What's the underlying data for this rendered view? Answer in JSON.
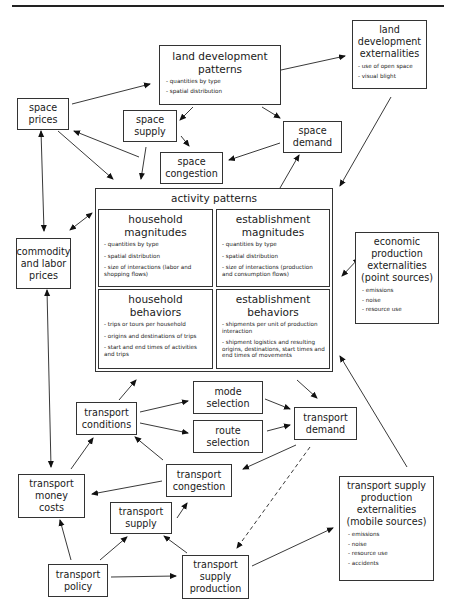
{
  "diagram": {
    "nodes": {
      "land_dev_patterns": {
        "title": "land development patterns",
        "title_l1": "land development",
        "title_l2": "patterns",
        "bullets": [
          "- quantities by type",
          "- spatial distribution"
        ]
      },
      "land_dev_externalities": {
        "title_l1": "land",
        "title_l2": "development",
        "title_l3": "externalities",
        "bullets": [
          "- use of open space",
          "- visual blight"
        ]
      },
      "space_prices": {
        "title_l1": "space",
        "title_l2": "prices"
      },
      "space_supply": {
        "title_l1": "space",
        "title_l2": "supply"
      },
      "space_demand": {
        "title_l1": "space",
        "title_l2": "demand"
      },
      "space_congestion": {
        "title_l1": "space",
        "title_l2": "congestion"
      },
      "activity_patterns": {
        "title": "activity patterns"
      },
      "household_magnitudes": {
        "title_l1": "household",
        "title_l2": "magnitudes",
        "bullets": [
          "- quantities by type",
          "- spatial distribution",
          "- size of interactions (labor and shopping flows)"
        ]
      },
      "establishment_magnitudes": {
        "title_l1": "establishment",
        "title_l2": "magnitudes",
        "bullets": [
          "- quantities by type",
          "- spatial distribution",
          "- size of interactions (production and consumption flows)"
        ]
      },
      "household_behaviors": {
        "title_l1": "household",
        "title_l2": "behaviors",
        "bullets": [
          "- trips or tours per household",
          "- origins and destinations of trips",
          "- start and end times of activities and trips"
        ]
      },
      "establishment_behaviors": {
        "title_l1": "establishment",
        "title_l2": "behaviors",
        "bullets": [
          "- shipments per unit of production interaction",
          "- shipment logistics and resulting origins, destinations, start times and end times of movements"
        ]
      },
      "commodity_labor_prices": {
        "title_l1": "commodity",
        "title_l2": "and labor",
        "title_l3": "prices"
      },
      "economic_externalities": {
        "title_l1": "economic",
        "title_l2": "production",
        "title_l3": "externalities",
        "title_l4": "(point sources)",
        "bullets": [
          "- emissions",
          "- noise",
          "- resource use"
        ]
      },
      "transport_conditions": {
        "title_l1": "transport",
        "title_l2": "conditions"
      },
      "mode_selection": {
        "title_l1": "mode",
        "title_l2": "selection"
      },
      "route_selection": {
        "title_l1": "route",
        "title_l2": "selection"
      },
      "transport_demand": {
        "title_l1": "transport",
        "title_l2": "demand"
      },
      "transport_congestion": {
        "title_l1": "transport",
        "title_l2": "congestion"
      },
      "transport_money_costs": {
        "title_l1": "transport",
        "title_l2": "money",
        "title_l3": "costs"
      },
      "transport_supply": {
        "title_l1": "transport",
        "title_l2": "supply"
      },
      "transport_policy": {
        "title_l1": "transport",
        "title_l2": "policy"
      },
      "transport_supply_production": {
        "title_l1": "transport",
        "title_l2": "supply",
        "title_l3": "production"
      },
      "transport_externalities": {
        "title_l1": "transport supply",
        "title_l2": "production",
        "title_l3": "externalities",
        "title_l4": "(mobile sources)",
        "bullets": [
          "- emissions",
          "- noise",
          "- resource use",
          "- accidents"
        ]
      }
    },
    "edges": [
      {
        "from": "space_prices",
        "to": "land_dev_patterns",
        "style": "solid"
      },
      {
        "from": "land_dev_patterns",
        "to": "land_dev_externalities",
        "style": "solid"
      },
      {
        "from": "land_dev_patterns",
        "to": "space_supply",
        "style": "solid"
      },
      {
        "from": "land_dev_patterns",
        "to": "space_demand",
        "style": "solid"
      },
      {
        "from": "space_supply",
        "to": "space_congestion",
        "style": "solid"
      },
      {
        "from": "space_demand",
        "to": "space_congestion",
        "style": "solid"
      },
      {
        "from": "space_congestion",
        "to": "space_prices",
        "style": "solid"
      },
      {
        "from": "space_prices",
        "to": "activity_patterns",
        "style": "solid"
      },
      {
        "from": "space_supply",
        "to": "activity_patterns",
        "style": "solid"
      },
      {
        "from": "activity_patterns",
        "to": "space_demand",
        "style": "solid"
      },
      {
        "from": "land_dev_externalities",
        "to": "activity_patterns",
        "style": "solid"
      },
      {
        "from": "space_prices",
        "to": "commodity_labor_prices",
        "style": "bidirectional"
      },
      {
        "from": "commodity_labor_prices",
        "to": "activity_patterns",
        "style": "bidirectional"
      },
      {
        "from": "activity_patterns",
        "to": "economic_externalities",
        "style": "bidirectional"
      },
      {
        "from": "commodity_labor_prices",
        "to": "transport_money_costs",
        "style": "bidirectional"
      },
      {
        "from": "transport_conditions",
        "to": "activity_patterns",
        "style": "solid"
      },
      {
        "from": "activity_patterns",
        "to": "transport_demand",
        "style": "solid"
      },
      {
        "from": "transport_externalities",
        "to": "activity_patterns",
        "style": "solid"
      },
      {
        "from": "transport_conditions",
        "to": "mode_selection",
        "style": "solid"
      },
      {
        "from": "transport_conditions",
        "to": "route_selection",
        "style": "solid"
      },
      {
        "from": "mode_selection",
        "to": "transport_demand",
        "style": "solid"
      },
      {
        "from": "route_selection",
        "to": "transport_demand",
        "style": "solid"
      },
      {
        "from": "transport_demand",
        "to": "transport_congestion",
        "style": "solid"
      },
      {
        "from": "transport_demand",
        "to": "transport_supply_production",
        "style": "dashed"
      },
      {
        "from": "transport_congestion",
        "to": "transport_conditions",
        "style": "solid"
      },
      {
        "from": "transport_congestion",
        "to": "transport_money_costs",
        "style": "solid"
      },
      {
        "from": "transport_money_costs",
        "to": "transport_conditions",
        "style": "solid"
      },
      {
        "from": "transport_supply",
        "to": "transport_congestion",
        "style": "solid"
      },
      {
        "from": "transport_policy",
        "to": "transport_money_costs",
        "style": "solid"
      },
      {
        "from": "transport_policy",
        "to": "transport_supply",
        "style": "solid"
      },
      {
        "from": "transport_policy",
        "to": "transport_supply_production",
        "style": "solid"
      },
      {
        "from": "transport_supply_production",
        "to": "transport_supply",
        "style": "solid"
      },
      {
        "from": "transport_supply_production",
        "to": "transport_externalities",
        "style": "solid"
      }
    ]
  }
}
